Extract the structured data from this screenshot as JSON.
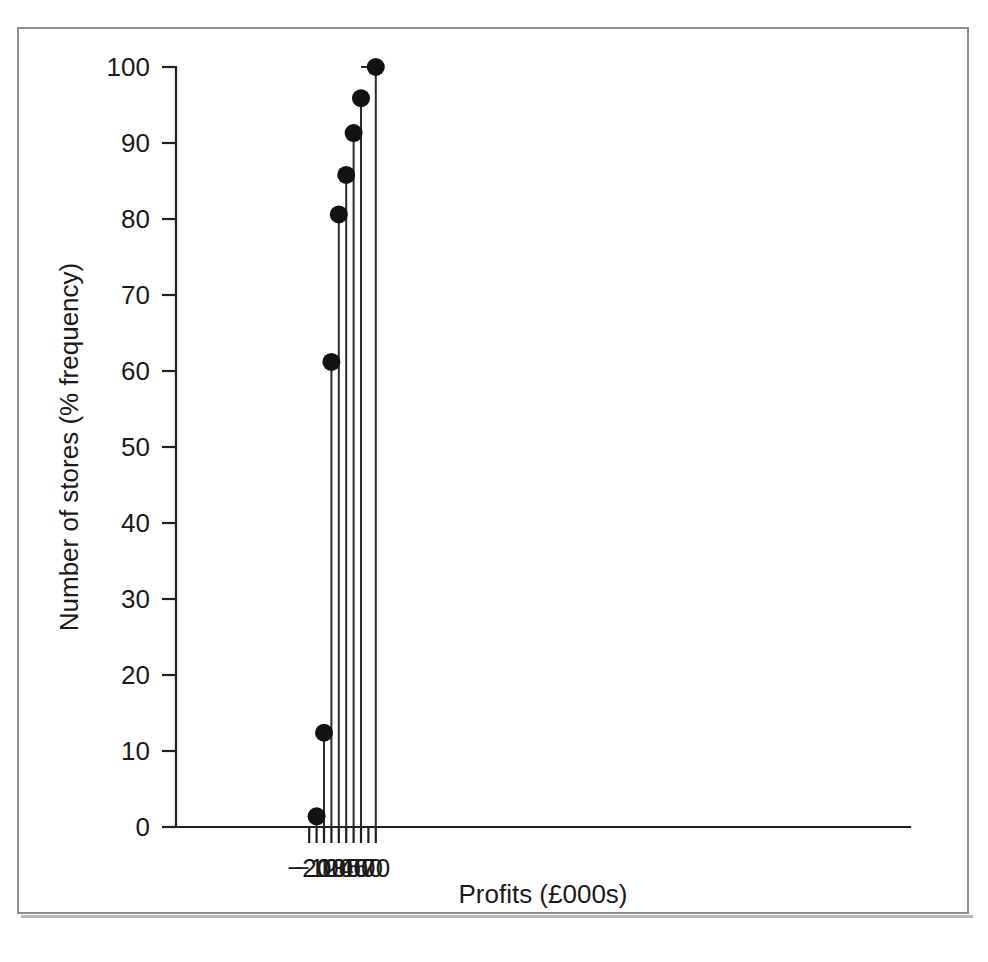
{
  "figure": {
    "frame_color": "#8e8e8e",
    "background": "#ffffff",
    "ink_color": "#1a1a1a"
  },
  "chart_data": {
    "type": "line",
    "subtype": "cumulative-frequency-step-ogive",
    "title": "",
    "xlabel": "Profits (£000s)",
    "ylabel": "Number of stores (% frequency)",
    "xlim": [
      -20,
      75
    ],
    "ylim": [
      0,
      100
    ],
    "grid": false,
    "legend": null,
    "xticks": [
      -20,
      -10,
      0,
      10,
      20,
      30,
      40,
      50,
      60,
      70
    ],
    "xtick_labels": [
      "−20",
      "−10",
      "0",
      "10",
      "20",
      "30",
      "40",
      "50",
      "60",
      "70"
    ],
    "yticks": [
      0,
      10,
      20,
      30,
      40,
      50,
      60,
      70,
      80,
      90,
      100
    ],
    "ytick_labels": [
      "0",
      "10",
      "20",
      "30",
      "40",
      "50",
      "60",
      "70",
      "80",
      "90",
      "100"
    ],
    "markers": "filled-circle",
    "x": [
      -10,
      0,
      10,
      20,
      30,
      40,
      50,
      70
    ],
    "values": [
      1.4,
      12.4,
      61.2,
      80.6,
      85.8,
      91.3,
      95.9,
      100.0
    ],
    "step_edges": [
      -20,
      -10,
      0,
      10,
      20,
      30,
      40,
      50,
      70
    ],
    "series": [
      {
        "name": "Cumulative % of stores",
        "points": [
          {
            "x": -10,
            "y": 1.4
          },
          {
            "x": 0,
            "y": 12.4
          },
          {
            "x": 10,
            "y": 61.2
          },
          {
            "x": 20,
            "y": 80.6
          },
          {
            "x": 30,
            "y": 85.8
          },
          {
            "x": 40,
            "y": 91.3
          },
          {
            "x": 50,
            "y": 95.9
          },
          {
            "x": 70,
            "y": 100.0
          }
        ]
      }
    ]
  }
}
